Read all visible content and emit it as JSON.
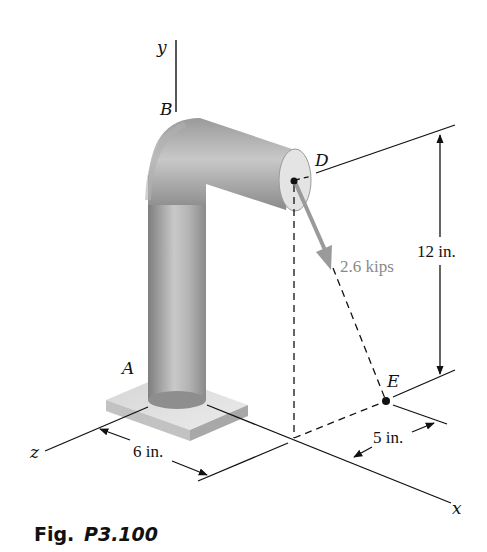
{
  "figure": {
    "caption_prefix": "Fig.",
    "caption_number": "P3.100"
  },
  "labels": {
    "y_axis": "y",
    "z_axis": "z",
    "x_axis": "x",
    "point_A": "A",
    "point_B": "B",
    "point_D": "D",
    "point_E": "E"
  },
  "dimensions": {
    "vertical": "12 in.",
    "z_offset": "6 in.",
    "x_offset": "5 in."
  },
  "force": {
    "label": "2.6 kips",
    "color": "#9a9a9a"
  },
  "colors": {
    "pipe_dark": "#8c8c8c",
    "pipe_light": "#cfcfcf",
    "pipe_end": "#e6e6e6",
    "base_top": "#e2e2e2",
    "base_side": "#bdbdbd",
    "line": "#111111"
  }
}
